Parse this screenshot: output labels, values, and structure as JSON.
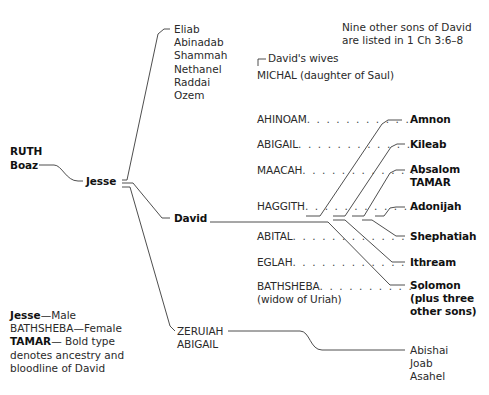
{
  "note": {
    "line1": "Nine other sons of David",
    "line2": "are listed in 1 Ch 3:6–8"
  },
  "ancestors": {
    "ruth": "RUTH",
    "boaz": "Boaz"
  },
  "jesse": "Jesse",
  "jesse_sons_other": [
    "Eliab",
    "Abinadab",
    "Shammah",
    "Nethanel",
    "Raddai",
    "Ozem"
  ],
  "david": "David",
  "wives_header": "David's wives",
  "wives": [
    {
      "name": "MICHAL (daughter of Saul)",
      "dots": ""
    },
    {
      "name": "AHINOAM",
      "dots": ". . . . . . . . . . ."
    },
    {
      "name": "ABIGAIL",
      "dots": ". . . . . . . . . . . . ."
    },
    {
      "name": "MAACAH",
      "dots": ". . . . . . . . . . . . ."
    },
    {
      "name": "HAGGITH",
      "dots": ". . . . . . . . . . . . ."
    },
    {
      "name": "ABITAL",
      "dots": ". . . . . . . . . . . . . . ."
    },
    {
      "name": "EGLAH",
      "dots": ". . . . . . . . . . . . . . . ."
    },
    {
      "name": "BATHSHEBA",
      "dots": ". . . . . . . . . . .",
      "subtitle": "(widow of Uriah)"
    }
  ],
  "children": {
    "amnon": "Amnon",
    "kileab": "Kileab",
    "absalom": "Absalom",
    "tamar": "TAMAR",
    "adonijah": "Adonijah",
    "shephatiah": "Shephatiah",
    "ithream": "Ithream",
    "solomon": "Solomon",
    "solomon_note1": "(plus three",
    "solomon_note2": "other sons)"
  },
  "daughters": {
    "zeruiah": "ZERUIAH",
    "abigail": "ABIGAIL"
  },
  "zeruiah_sons": [
    "Abishai",
    "Joab",
    "Asahel"
  ],
  "legend": {
    "male_sample": "Jesse",
    "male_desc": "—Male",
    "female_sample": "BATHSHEBA",
    "female_desc": "—Female",
    "bold_sample": "TAMAR",
    "bold_desc": "— Bold type",
    "bold_desc2": "denotes ancestry and",
    "bold_desc3": "bloodline of David"
  }
}
